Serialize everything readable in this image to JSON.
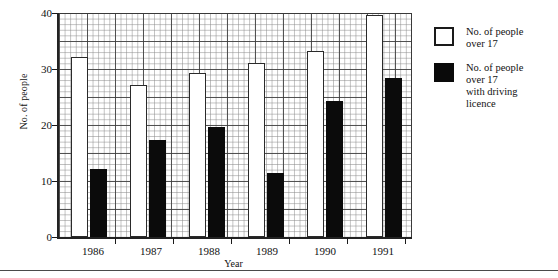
{
  "chart_data": {
    "type": "bar",
    "title": "",
    "xlabel": "Year",
    "ylabel": "No. of people",
    "categories": [
      "1986",
      "1987",
      "1988",
      "1989",
      "1990",
      "1991"
    ],
    "ylim": [
      0,
      40
    ],
    "yticks": [
      0,
      10,
      20,
      30,
      40
    ],
    "grid": true,
    "legend_position": "right",
    "series": [
      {
        "name": "No. of people over 17",
        "style": "open",
        "color": "#ffffff",
        "values": [
          32.1,
          27.1,
          29.3,
          31.1,
          33.2,
          39.6
        ]
      },
      {
        "name": "No. of people over 17 with driving licence",
        "style": "filled",
        "color": "#0b0b0b",
        "values": [
          12.1,
          17.3,
          19.6,
          11.4,
          24.3,
          28.4
        ]
      }
    ]
  },
  "axes": {
    "y_title": "No. of people",
    "x_title": "Year",
    "y_tick_labels": [
      "40",
      "30",
      "20",
      "10",
      "0"
    ],
    "x_tick_labels": [
      "1986",
      "1987",
      "1988",
      "1989",
      "1990",
      "1991"
    ]
  },
  "legend": {
    "entries": [
      {
        "swatch": "open-square",
        "lines": [
          "No. of people",
          "over 17"
        ]
      },
      {
        "swatch": "filled-square",
        "lines": [
          "No. of people",
          "over 17",
          "with driving",
          "licence"
        ]
      }
    ]
  },
  "colors": {
    "bar_open_fill": "#ffffff",
    "bar_open_stroke": "#2a2a2a",
    "bar_filled": "#0b0b0b",
    "axis": "#222222",
    "grid_major": "#3c3c3c",
    "grid_minor": "#8c8c8c",
    "page_background": "#ffffff"
  }
}
